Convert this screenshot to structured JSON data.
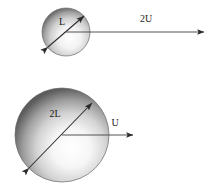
{
  "diagram": {
    "background_color": "#ffffff",
    "stroke_color": "#333333",
    "label_color": "#1a1a1a",
    "sphere_light_color": "#ffffff",
    "sphere_mid_color": "#b8b8b8",
    "sphere_dark_color": "#5a5a5a",
    "objects": [
      {
        "id": "small-sphere",
        "kind": "sphere",
        "center_x": 66,
        "center_y": 32,
        "radius": 24,
        "diameter_label": "L",
        "diameter_label_x": 62,
        "diameter_label_y": 25,
        "velocity_label": "2U",
        "velocity_label_x": 146,
        "velocity_label_y": 22,
        "arrow_start_x": 66,
        "arrow_start_y": 32,
        "arrow_end_x": 204,
        "arrow_end_y": 32,
        "diag_x1": 48,
        "diag_y1": 47,
        "diag_x2": 84,
        "diag_y2": 16
      },
      {
        "id": "large-sphere",
        "kind": "sphere",
        "center_x": 62,
        "center_y": 135,
        "radius": 47,
        "diameter_label": "2L",
        "diameter_label_x": 55,
        "diameter_label_y": 117,
        "velocity_label": "U",
        "velocity_label_x": 115,
        "velocity_label_y": 126,
        "arrow_start_x": 62,
        "arrow_start_y": 135,
        "arrow_end_x": 133,
        "arrow_end_y": 135,
        "diag_x1": 29,
        "diag_y1": 168,
        "diag_x2": 92,
        "diag_y2": 103
      }
    ]
  }
}
